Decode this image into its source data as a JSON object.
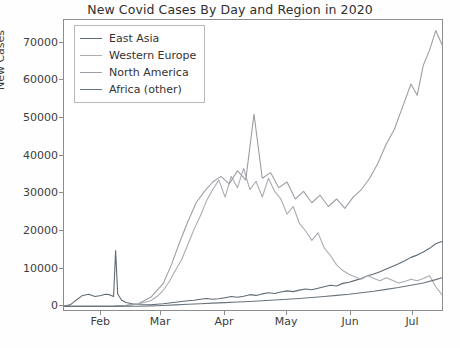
{
  "chart_data": {
    "type": "line",
    "title": "New Covid Cases By Day and Region in 2020",
    "xlabel": "",
    "ylabel": "New Cases",
    "ylim": [
      -1500,
      76000
    ],
    "yticks": [
      0,
      10000,
      20000,
      30000,
      40000,
      50000,
      60000,
      70000
    ],
    "ytick_labels": [
      "0",
      "10000",
      "20000",
      "30000",
      "40000",
      "50000",
      "60000",
      "70000"
    ],
    "xlim": [
      14,
      198
    ],
    "xticks": [
      32,
      61,
      92,
      122,
      153,
      183
    ],
    "xtick_labels": [
      "Feb",
      "Mar",
      "Apr",
      "May",
      "Jun",
      "Jul"
    ],
    "grid": false,
    "legend_position": "upper left",
    "series": [
      {
        "name": "East Asia",
        "color": "#5f6a74",
        "x": [
          14,
          17,
          20,
          23,
          26,
          29,
          32,
          34,
          36,
          38,
          39,
          40,
          41,
          42,
          44,
          47,
          50,
          53,
          56,
          59,
          62,
          65,
          68,
          71,
          74,
          77,
          80,
          83,
          86,
          89,
          92,
          95,
          98,
          101,
          104,
          107,
          110,
          113,
          116,
          119,
          122,
          125,
          128,
          131,
          134,
          137,
          140,
          143,
          146,
          149,
          152,
          155,
          158,
          161,
          164,
          167,
          170,
          173,
          176,
          179,
          182,
          185,
          188,
          191,
          194,
          197
        ],
        "values": [
          60,
          400,
          1700,
          2900,
          3200,
          2600,
          2900,
          3200,
          3100,
          2600,
          14800,
          3300,
          2400,
          1600,
          1000,
          700,
          500,
          420,
          380,
          560,
          700,
          900,
          1100,
          1300,
          1500,
          1600,
          1900,
          2100,
          1900,
          2000,
          2300,
          2600,
          2400,
          2700,
          3100,
          2900,
          3300,
          3600,
          3400,
          3800,
          4100,
          3900,
          4300,
          4600,
          4400,
          4800,
          5200,
          5600,
          5400,
          6100,
          6400,
          6900,
          7400,
          8100,
          8600,
          9200,
          9900,
          10600,
          11300,
          12100,
          13000,
          13600,
          14400,
          15400,
          16600,
          17200
        ]
      },
      {
        "name": "Western Europe",
        "color": "#a9acb1",
        "x": [
          14,
          20,
          26,
          32,
          38,
          44,
          50,
          56,
          59,
          62,
          65,
          68,
          71,
          74,
          77,
          80,
          83,
          86,
          89,
          92,
          95,
          98,
          101,
          104,
          107,
          110,
          113,
          116,
          119,
          122,
          125,
          128,
          131,
          134,
          137,
          140,
          143,
          146,
          149,
          152,
          155,
          158,
          161,
          164,
          167,
          170,
          173,
          176,
          179,
          182,
          185,
          188,
          191,
          194,
          197
        ],
        "values": [
          5,
          10,
          15,
          30,
          90,
          260,
          620,
          1500,
          2600,
          4200,
          6600,
          9600,
          12500,
          16400,
          20500,
          24000,
          28000,
          31000,
          33500,
          29000,
          34500,
          31500,
          36600,
          31000,
          33200,
          29000,
          34000,
          30500,
          28500,
          24500,
          26500,
          22000,
          20000,
          17500,
          19500,
          15500,
          13500,
          11000,
          9500,
          8500,
          7800,
          7200,
          8200,
          7400,
          6800,
          7600,
          6900,
          6200,
          6600,
          7200,
          6800,
          7400,
          8100,
          5200,
          3100
        ]
      },
      {
        "name": "North America",
        "color": "#9b9fa5",
        "x": [
          14,
          20,
          26,
          32,
          38,
          44,
          50,
          56,
          62,
          66,
          70,
          74,
          78,
          82,
          86,
          90,
          94,
          98,
          102,
          106,
          110,
          114,
          118,
          122,
          126,
          130,
          134,
          138,
          142,
          146,
          150,
          154,
          158,
          162,
          166,
          170,
          174,
          178,
          182,
          185,
          188,
          191,
          194,
          197
        ],
        "values": [
          2,
          5,
          8,
          20,
          60,
          200,
          700,
          2400,
          6000,
          11000,
          17000,
          22500,
          27500,
          30500,
          33000,
          34500,
          32500,
          36000,
          33500,
          51000,
          34000,
          35500,
          31500,
          33000,
          28500,
          30500,
          27500,
          29500,
          26500,
          28500,
          26000,
          29000,
          31000,
          34000,
          38000,
          43000,
          47000,
          53000,
          59000,
          56000,
          64000,
          68000,
          73200,
          69500
        ]
      },
      {
        "name": "Africa (other)",
        "color": "#6a747e",
        "x": [
          14,
          20,
          26,
          32,
          38,
          44,
          50,
          56,
          62,
          68,
          74,
          80,
          86,
          92,
          98,
          104,
          110,
          116,
          122,
          128,
          134,
          140,
          146,
          152,
          158,
          164,
          170,
          176,
          182,
          188,
          194,
          197
        ],
        "values": [
          0,
          0,
          1,
          2,
          5,
          12,
          40,
          110,
          230,
          400,
          560,
          700,
          860,
          1000,
          1150,
          1300,
          1500,
          1700,
          1900,
          2100,
          2350,
          2600,
          2900,
          3200,
          3600,
          4000,
          4500,
          5000,
          5600,
          6200,
          7100,
          7600
        ]
      }
    ]
  },
  "legend": {
    "items": [
      {
        "label": "East Asia"
      },
      {
        "label": "Western Europe"
      },
      {
        "label": "North America"
      },
      {
        "label": "Africa (other)"
      }
    ]
  }
}
